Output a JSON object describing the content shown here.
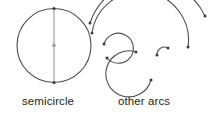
{
  "figure": {
    "background_color": "#ffffff",
    "stroke_color": "#4d4d4f",
    "dot_color": "#3b3b3d",
    "text_color": "#231f20",
    "stroke_width": 1.1,
    "dot_radius": 1.5
  },
  "labels": {
    "left": "semicircle",
    "right": "other arcs"
  },
  "shapes": {
    "circle": {
      "name": "semicircle-circle",
      "cx": 54,
      "cy": 45.5,
      "r": 37
    },
    "diameter": {
      "name": "vertical-diameter",
      "x1": 54,
      "y1": 8.5,
      "x2": 54,
      "y2": 82.5
    },
    "points": [
      {
        "name": "diameter-top-point",
        "cx": 54,
        "cy": 8.5
      },
      {
        "name": "circle-center-point",
        "cx": 54,
        "cy": 45.5
      },
      {
        "name": "diameter-bottom-point",
        "cx": 54,
        "cy": 82.5
      }
    ],
    "arcs": [
      {
        "name": "outer-large-arc",
        "path": "M 90 23 A 62 62 0 0 1 205 16",
        "endpoints": [
          {
            "cx": 90,
            "cy": 23
          },
          {
            "cx": 205,
            "cy": 16
          }
        ]
      },
      {
        "name": "second-large-arc",
        "path": "M 92 33 A 48 48 0 0 1 188 47",
        "endpoints": [
          {
            "cx": 92,
            "cy": 33
          },
          {
            "cx": 188,
            "cy": 47
          }
        ]
      },
      {
        "name": "upper-spiral-arc",
        "path": "M 104 44 A 15 15 0 1 1 107 58",
        "endpoints": [
          {
            "cx": 104,
            "cy": 44
          },
          {
            "cx": 107,
            "cy": 58
          }
        ]
      },
      {
        "name": "lower-large-spiral-arc",
        "path": "M 136 52 A 23 23 0 1 0 151 80",
        "endpoints": [
          {
            "cx": 136,
            "cy": 52
          },
          {
            "cx": 151,
            "cy": 80
          }
        ]
      },
      {
        "name": "inner-small-arc",
        "path": "M 157 55 A 7.5 7.5 0 0 1 168 48",
        "endpoints": [
          {
            "cx": 157,
            "cy": 55
          },
          {
            "cx": 168,
            "cy": 48
          }
        ]
      }
    ]
  }
}
